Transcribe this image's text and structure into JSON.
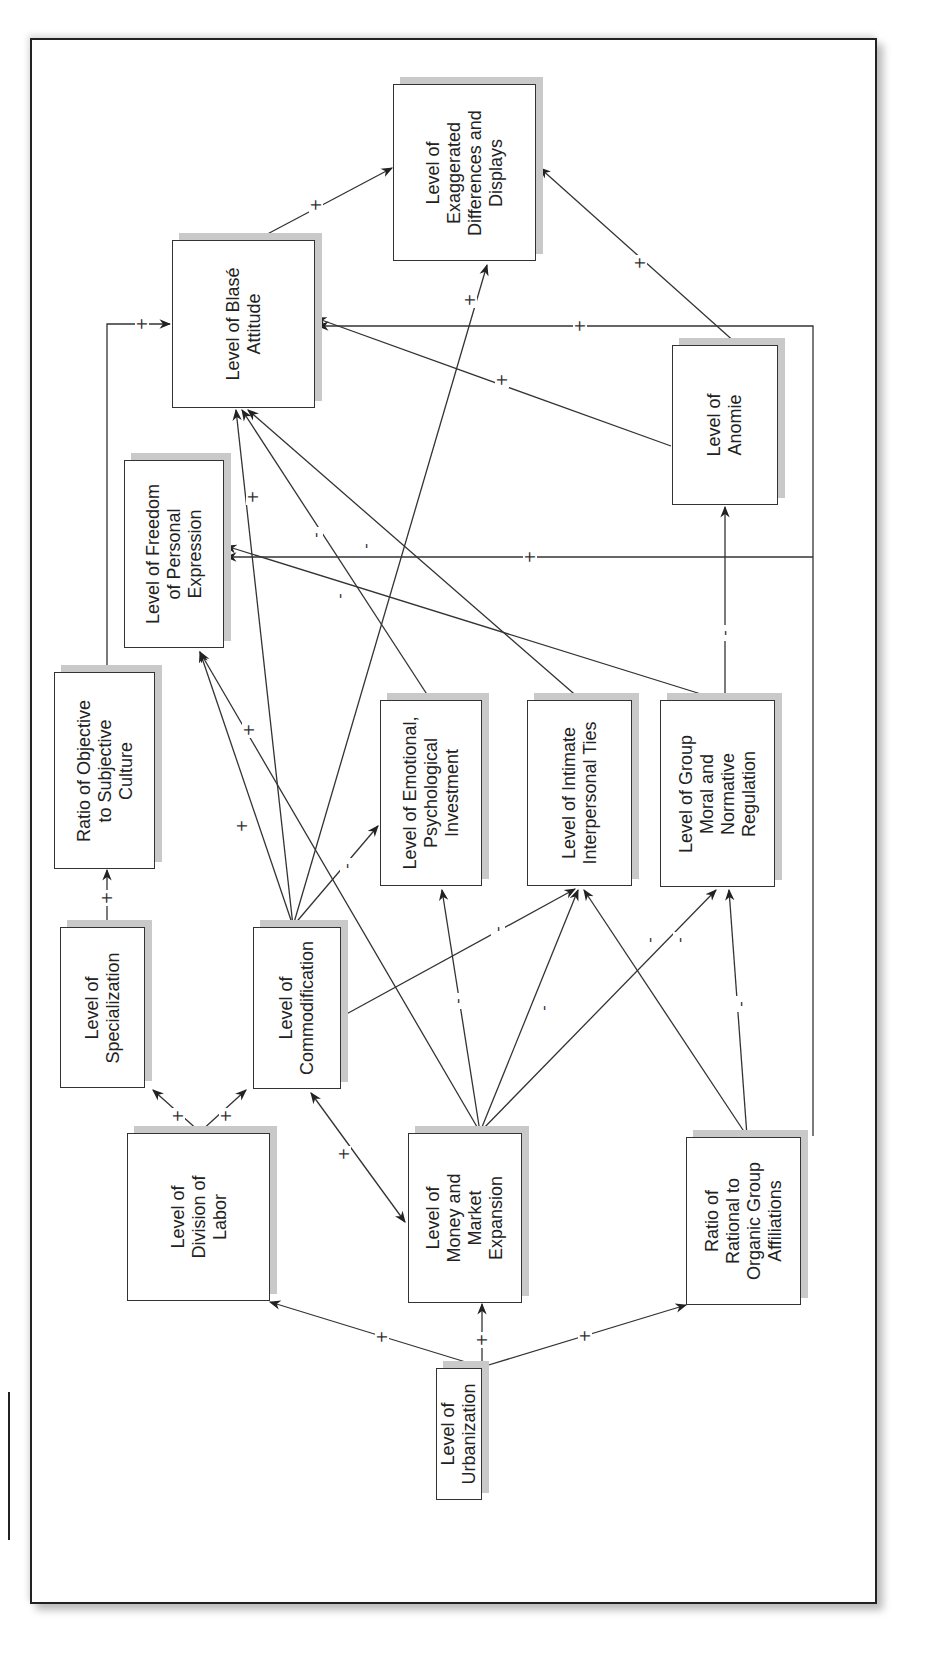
{
  "diagram": {
    "orientation": "rotated-90-ccw",
    "nodes": [
      {
        "id": "urbanization",
        "label": "Level of\nUrbanization",
        "box": [
          436,
          1368,
          46,
          132
        ]
      },
      {
        "id": "division_of_labor",
        "label": "Level of\nDivision of\nLabor",
        "box": [
          127,
          1133,
          143,
          168
        ]
      },
      {
        "id": "money_market",
        "label": "Level of\nMoney and\nMarket\nExpansion",
        "box": [
          408,
          1133,
          114,
          170
        ]
      },
      {
        "id": "rational_organic",
        "label": "Ratio of\nRational to\nOrganic Group\nAffiliations",
        "box": [
          686,
          1137,
          115,
          168
        ]
      },
      {
        "id": "specialization",
        "label": "Level of\nSpecialization",
        "box": [
          60,
          927,
          85,
          161
        ]
      },
      {
        "id": "commodification",
        "label": "Level of\nCommodification",
        "box": [
          253,
          927,
          88,
          162
        ]
      },
      {
        "id": "objective_subjective",
        "label": "Ratio of Objective\nto Subjective\nCulture",
        "box": [
          54,
          672,
          101,
          197
        ]
      },
      {
        "id": "emotional_investment",
        "label": "Level of Emotional,\nPsychological\nInvestment",
        "box": [
          380,
          700,
          102,
          186
        ]
      },
      {
        "id": "intimate_ties",
        "label": "Level of Intimate\nInterpersonal Ties",
        "box": [
          527,
          700,
          105,
          186
        ]
      },
      {
        "id": "group_moral",
        "label": "Level of Group\nMoral and\nNormative\nRegulation",
        "box": [
          660,
          700,
          115,
          187
        ]
      },
      {
        "id": "freedom_expression",
        "label": "Level of Freedom\nof Personal\nExpression",
        "box": [
          124,
          460,
          100,
          188
        ]
      },
      {
        "id": "anomie",
        "label": "Level of\nAnomie",
        "box": [
          672,
          345,
          106,
          160
        ]
      },
      {
        "id": "blase_attitude",
        "label": "Level of Blasé\nAttitude",
        "box": [
          172,
          240,
          143,
          168
        ]
      },
      {
        "id": "exaggerated_differences",
        "label": "Level of\nExaggerated\nDifferences and\nDisplays",
        "box": [
          393,
          84,
          143,
          177
        ]
      }
    ],
    "edges": [
      {
        "from": "urbanization",
        "to": "division_of_labor",
        "sign": "+",
        "path": [
          [
            482,
            1367
          ],
          [
            270,
            1302
          ]
        ],
        "label_at": [
          382,
          1337
        ]
      },
      {
        "from": "urbanization",
        "to": "money_market",
        "sign": "+",
        "path": [
          [
            482,
            1367
          ],
          [
            482,
            1304
          ]
        ],
        "label_at": [
          482,
          1340
        ]
      },
      {
        "from": "urbanization",
        "to": "rational_organic",
        "sign": "+",
        "path": [
          [
            482,
            1367
          ],
          [
            686,
            1305
          ]
        ],
        "label_at": [
          585,
          1336
        ]
      },
      {
        "from": "division_of_labor",
        "to": "specialization",
        "sign": "+",
        "path": [
          [
            200,
            1132
          ],
          [
            153,
            1090
          ]
        ],
        "label_at": [
          178,
          1116
        ]
      },
      {
        "from": "division_of_labor",
        "to": "commodification",
        "sign": "+",
        "path": [
          [
            200,
            1132
          ],
          [
            246,
            1090
          ]
        ],
        "label_at": [
          226,
          1116
        ]
      },
      {
        "from": "commodification",
        "to": "money_market",
        "sign": "+",
        "path": [
          [
            311,
            1093
          ],
          [
            405,
            1222
          ]
        ],
        "bidirectional": true,
        "label_at": [
          344,
          1154
        ]
      },
      {
        "from": "specialization",
        "to": "objective_subjective",
        "sign": "+",
        "path": [
          [
            107,
            926
          ],
          [
            107,
            870
          ]
        ],
        "label_at": [
          107,
          898
        ]
      },
      {
        "from": "objective_subjective",
        "to": "blase_attitude",
        "sign": "+",
        "path": [
          [
            107,
            671
          ],
          [
            107,
            324
          ],
          [
            170,
            324
          ]
        ],
        "label_at": [
          142,
          324
        ]
      },
      {
        "from": "commodification",
        "to": "freedom_expression",
        "sign": "+",
        "path": [
          [
            293,
            926
          ],
          [
            200,
            652
          ]
        ],
        "label_at": [
          242,
          826
        ]
      },
      {
        "from": "money_market",
        "to": "freedom_expression",
        "sign": "+",
        "path": [
          [
            480,
            1132
          ],
          [
            200,
            652
          ]
        ],
        "label_at": [
          249,
          730
        ]
      },
      {
        "from": "commodification",
        "to": "blase_attitude",
        "sign": "+",
        "path": [
          [
            293,
            926
          ],
          [
            236,
            410
          ]
        ],
        "label_at": [
          253,
          497
        ]
      },
      {
        "from": "commodification",
        "to": "exaggerated_differences",
        "sign": "+",
        "path": [
          [
            293,
            926
          ],
          [
            487,
            265
          ]
        ],
        "label_at": [
          470,
          300
        ]
      },
      {
        "from": "commodification",
        "to": "emotional_investment",
        "sign": "-",
        "path": [
          [
            293,
            926
          ],
          [
            378,
            826
          ]
        ],
        "label_at": [
          347,
          866
        ]
      },
      {
        "from": "commodification",
        "to": "intimate_ties",
        "sign": "-",
        "path": [
          [
            341,
            1017
          ],
          [
            575,
            889
          ]
        ],
        "label_at": [
          498,
          929
        ]
      },
      {
        "from": "emotional_investment",
        "to": "blase_attitude",
        "sign": "-",
        "path": [
          [
            430,
            699
          ],
          [
            242,
            410
          ]
        ],
        "label_at": [
          316,
          535
        ]
      },
      {
        "from": "intimate_ties",
        "to": "blase_attitude",
        "sign": "-",
        "path": [
          [
            580,
            699
          ],
          [
            248,
            410
          ]
        ],
        "label_at": [
          366,
          546
        ]
      },
      {
        "from": "group_moral",
        "to": "freedom_expression",
        "sign": "-",
        "path": [
          [
            717,
            699
          ],
          [
            226,
            546
          ]
        ],
        "label_at": [
          340,
          596
        ]
      },
      {
        "from": "group_moral",
        "to": "anomie",
        "sign": "-",
        "path": [
          [
            725,
            699
          ],
          [
            725,
            507
          ]
        ],
        "label_at": [
          725,
          633
        ]
      },
      {
        "from": "anomie",
        "to": "blase_attitude",
        "sign": "+",
        "path": [
          [
            671,
            446
          ],
          [
            316,
            318
          ]
        ],
        "label_at": [
          502,
          380
        ]
      },
      {
        "from": "anomie",
        "to": "exaggerated_differences",
        "sign": "+",
        "path": [
          [
            737,
            344
          ],
          [
            540,
            168
          ]
        ],
        "label_at": [
          640,
          263
        ]
      },
      {
        "from": "blase_attitude",
        "to": "exaggerated_differences",
        "sign": "+",
        "path": [
          [
            258,
            239
          ],
          [
            392,
            168
          ]
        ],
        "label_at": [
          316,
          205
        ]
      },
      {
        "from": "money_market",
        "to": "emotional_investment",
        "sign": "-",
        "path": [
          [
            480,
            1132
          ],
          [
            442,
            890
          ]
        ],
        "label_at": [
          458,
          1001
        ]
      },
      {
        "from": "money_market",
        "to": "intimate_ties",
        "sign": "-",
        "path": [
          [
            480,
            1132
          ],
          [
            578,
            890
          ]
        ],
        "label_at": [
          544,
          1008
        ]
      },
      {
        "from": "money_market",
        "to": "group_moral",
        "sign": "-",
        "path": [
          [
            480,
            1132
          ],
          [
            716,
            890
          ]
        ],
        "label_at": [
          680,
          940
        ]
      },
      {
        "from": "rational_organic",
        "to": "intimate_ties",
        "sign": "-",
        "path": [
          [
            747,
            1136
          ],
          [
            584,
            890
          ]
        ],
        "label_at": [
          650,
          940
        ]
      },
      {
        "from": "rational_organic",
        "to": "group_moral",
        "sign": "-",
        "path": [
          [
            747,
            1136
          ],
          [
            729,
            890
          ]
        ],
        "label_at": [
          741,
          1004
        ]
      },
      {
        "from": "rational_organic",
        "to": "blase_attitude",
        "sign": "+",
        "path": [
          [
            813,
            1136
          ],
          [
            813,
            326
          ],
          [
            318,
            326
          ]
        ],
        "label_at": [
          580,
          326
        ]
      },
      {
        "from": "rational_organic",
        "to": "freedom_expression",
        "sign": "+",
        "path": [
          [
            813,
            557
          ],
          [
            226,
            557
          ]
        ],
        "label_at": [
          530,
          557
        ]
      }
    ]
  }
}
